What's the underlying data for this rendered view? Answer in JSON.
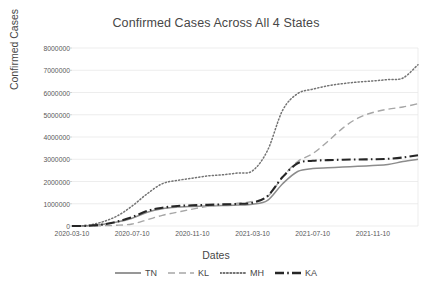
{
  "chart_data": {
    "type": "line",
    "title": "Confirmed Cases Across All 4 States",
    "xlabel": "Dates",
    "ylabel": "Confirmed Cases",
    "grid": true,
    "legend_position": "bottom",
    "ylim": [
      0,
      8000000
    ],
    "yticks": [
      0,
      1000000,
      2000000,
      3000000,
      4000000,
      5000000,
      6000000,
      7000000,
      8000000
    ],
    "ytick_labels": [
      "0",
      "1000000",
      "2000000",
      "3000000",
      "4000000",
      "5000000",
      "6000000",
      "7000000",
      "8000000"
    ],
    "xtick_labels": [
      "2020-03-10",
      "2020-07-10",
      "2020-11-10",
      "2021-03-10",
      "2021-07-10",
      "2021-11-10"
    ],
    "x": [
      "2020-03-10",
      "2020-04-10",
      "2020-05-10",
      "2020-06-10",
      "2020-07-10",
      "2020-08-10",
      "2020-09-10",
      "2020-10-10",
      "2020-11-10",
      "2020-12-10",
      "2021-01-10",
      "2021-02-10",
      "2021-03-10",
      "2021-04-10",
      "2021-05-10",
      "2021-06-10",
      "2021-07-10",
      "2021-08-10",
      "2021-09-10",
      "2021-10-10",
      "2021-11-10",
      "2021-12-10",
      "2022-01-10",
      "2022-02-10"
    ],
    "series": [
      {
        "name": "TN",
        "style": "solid",
        "color": "#8c8c8c",
        "values": [
          1000,
          9000,
          70000,
          180000,
          350000,
          620000,
          780000,
          850000,
          880000,
          900000,
          920000,
          940000,
          980000,
          1150000,
          1900000,
          2450000,
          2580000,
          2620000,
          2650000,
          2680000,
          2720000,
          2760000,
          2900000,
          3000000
        ]
      },
      {
        "name": "KL",
        "style": "dashed",
        "color": "#a6a6a6",
        "values": [
          500,
          3000,
          12000,
          35000,
          90000,
          280000,
          480000,
          620000,
          760000,
          880000,
          960000,
          1020000,
          1100000,
          1320000,
          2200000,
          2900000,
          3250000,
          3800000,
          4400000,
          4850000,
          5100000,
          5250000,
          5350000,
          5500000
        ]
      },
      {
        "name": "MH",
        "style": "dotted",
        "color": "#737373",
        "values": [
          2000,
          25000,
          180000,
          450000,
          900000,
          1450000,
          1900000,
          2050000,
          2150000,
          2250000,
          2300000,
          2380000,
          2480000,
          3400000,
          5200000,
          5950000,
          6150000,
          6300000,
          6400000,
          6470000,
          6520000,
          6580000,
          6650000,
          7250000
        ]
      },
      {
        "name": "KA",
        "style": "dashdot",
        "color": "#262626",
        "values": [
          1000,
          8000,
          60000,
          200000,
          400000,
          680000,
          820000,
          900000,
          930000,
          950000,
          970000,
          990000,
          1050000,
          1350000,
          2200000,
          2820000,
          2930000,
          2960000,
          2980000,
          2990000,
          3000000,
          3020000,
          3080000,
          3180000
        ]
      }
    ]
  },
  "legend": {
    "entries": [
      {
        "label": "TN",
        "icon": "solid-line-icon"
      },
      {
        "label": "KL",
        "icon": "dashed-line-icon"
      },
      {
        "label": "MH",
        "icon": "dotted-line-icon"
      },
      {
        "label": "KA",
        "icon": "dashdot-line-icon"
      }
    ]
  }
}
